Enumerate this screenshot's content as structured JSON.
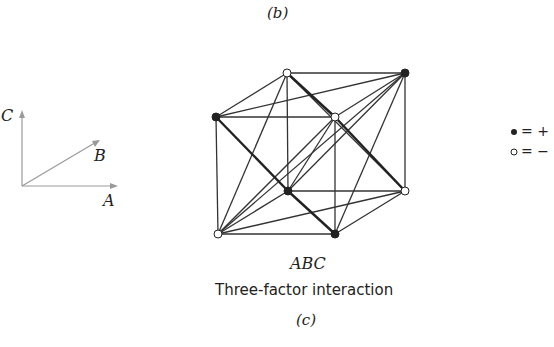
{
  "figure": {
    "top_caption": "(b)",
    "axes": {
      "c_label": "C",
      "b_label": "B",
      "a_label": "A"
    },
    "cube": {
      "title": "ABC",
      "subtitle": "Three-factor interaction",
      "caption": "(c)",
      "vertices": [
        {
          "id": "back-top-left",
          "x": 287,
          "y": 73,
          "sign": "-"
        },
        {
          "id": "back-top-right",
          "x": 405,
          "y": 73,
          "sign": "+"
        },
        {
          "id": "front-top-left",
          "x": 216,
          "y": 117,
          "sign": "+"
        },
        {
          "id": "front-top-right",
          "x": 335,
          "y": 117,
          "sign": "-"
        },
        {
          "id": "back-bottom-left",
          "x": 288,
          "y": 191,
          "sign": "+"
        },
        {
          "id": "back-bottom-right",
          "x": 405,
          "y": 191,
          "sign": "-"
        },
        {
          "id": "front-bottom-left",
          "x": 218,
          "y": 234,
          "sign": "-"
        },
        {
          "id": "front-bottom-right",
          "x": 335,
          "y": 234,
          "sign": "+"
        }
      ]
    },
    "legend": {
      "plus_label": "= +",
      "minus_label": "= −"
    }
  }
}
